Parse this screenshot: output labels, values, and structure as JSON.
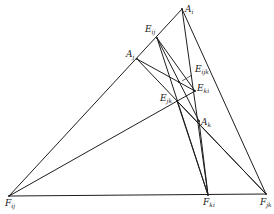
{
  "diagram": {
    "type": "geometric-construction",
    "points": {
      "A_i": {
        "label": "A",
        "sub": "i",
        "x": 182,
        "y": 9
      },
      "E_ij": {
        "label": "E",
        "sub": "ij",
        "x": 157,
        "y": 38
      },
      "A_j": {
        "label": "A",
        "sub": "j",
        "x": 137,
        "y": 59
      },
      "E_ijk": {
        "label": "E",
        "sub": "ijk",
        "x": 179,
        "y": 82
      },
      "E_ki": {
        "label": "E",
        "sub": "ki",
        "x": 195,
        "y": 91
      },
      "E_jk": {
        "label": "E",
        "sub": "jk",
        "x": 177,
        "y": 101
      },
      "A_k": {
        "label": "A",
        "sub": "k",
        "x": 199,
        "y": 121
      },
      "F_ij": {
        "label": "F",
        "sub": "ij",
        "x": 9,
        "y": 196
      },
      "F_ki": {
        "label": "F",
        "sub": "ki",
        "x": 208,
        "y": 195
      },
      "F_jk": {
        "label": "F",
        "sub": "jk",
        "x": 266,
        "y": 194
      }
    },
    "labels": [
      {
        "id": "A_i",
        "main": "A",
        "sub": "i",
        "x": 185,
        "y": 12
      },
      {
        "id": "E_ij",
        "main": "E",
        "sub": "ij",
        "x": 145,
        "y": 32
      },
      {
        "id": "A_j",
        "main": "A",
        "sub": "j",
        "x": 126,
        "y": 57
      },
      {
        "id": "E_ijk",
        "main": "E",
        "sub": "ijk",
        "x": 195,
        "y": 72
      },
      {
        "id": "E_ki",
        "main": "E",
        "sub": "ki",
        "x": 197,
        "y": 91
      },
      {
        "id": "E_jk",
        "main": "E",
        "sub": "jk",
        "x": 160,
        "y": 101
      },
      {
        "id": "A_k",
        "main": "A",
        "sub": "k",
        "x": 201,
        "y": 125
      },
      {
        "id": "F_ij",
        "main": "F",
        "sub": "ij",
        "x": 5,
        "y": 206
      },
      {
        "id": "F_ki",
        "main": "F",
        "sub": "ki",
        "x": 203,
        "y": 205
      },
      {
        "id": "F_jk",
        "main": "F",
        "sub": "jk",
        "x": 260,
        "y": 205
      }
    ],
    "segments": [
      [
        "F_ij",
        "A_i"
      ],
      [
        "F_ij",
        "F_jk"
      ],
      [
        "A_i",
        "F_ki"
      ],
      [
        "A_i",
        "F_jk"
      ],
      [
        "A_j",
        "F_jk"
      ],
      [
        "A_j",
        "E_ki"
      ],
      [
        "E_ij",
        "F_ki"
      ],
      [
        "E_ij",
        "A_k"
      ],
      [
        "E_ij",
        "E_ki"
      ],
      [
        "F_ij",
        "E_ki"
      ],
      [
        "E_jk",
        "F_jk"
      ],
      [
        "A_k",
        "F_ki"
      ],
      [
        "E_jk",
        "F_ki"
      ]
    ]
  }
}
